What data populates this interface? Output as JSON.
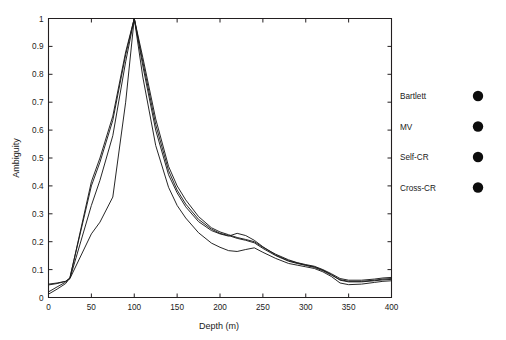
{
  "chart_data": {
    "type": "line",
    "title": "",
    "xlabel": "Depth (m)",
    "ylabel": "Ambiguity",
    "xlim": [
      0,
      400
    ],
    "ylim": [
      0,
      1
    ],
    "grid": false,
    "legend_position": "right-outside",
    "xticks": [
      0,
      50,
      100,
      150,
      200,
      250,
      300,
      350,
      400
    ],
    "xtick_labels": [
      "0",
      "50",
      "100",
      "150",
      "200",
      "250",
      "300",
      "350",
      "400"
    ],
    "yticks": [
      0,
      0.1,
      0.2,
      0.3,
      0.4,
      0.5,
      0.6,
      0.7,
      0.8,
      0.9,
      1
    ],
    "ytick_labels": [
      "0",
      "0.1",
      "0.2",
      "0.3",
      "0.4",
      "0.5",
      "0.6",
      "0.7",
      "0.8",
      "0.9",
      "1"
    ],
    "x": [
      0,
      10,
      20,
      25,
      50,
      60,
      75,
      90,
      100,
      110,
      125,
      140,
      150,
      160,
      175,
      190,
      200,
      210,
      220,
      230,
      240,
      250,
      265,
      280,
      290,
      300,
      310,
      320,
      330,
      340,
      350,
      365,
      380,
      390,
      400
    ],
    "series": [
      {
        "name": "Bartlett",
        "marker": "filled-circle",
        "color": "#0d0d0d",
        "values": [
          0.012,
          0.03,
          0.05,
          0.07,
          0.415,
          0.5,
          0.65,
          0.88,
          1.0,
          0.86,
          0.64,
          0.47,
          0.4,
          0.35,
          0.29,
          0.25,
          0.235,
          0.225,
          0.215,
          0.208,
          0.2,
          0.18,
          0.155,
          0.135,
          0.125,
          0.118,
          0.112,
          0.1,
          0.085,
          0.068,
          0.062,
          0.062,
          0.066,
          0.07,
          0.072
        ]
      },
      {
        "name": "MV",
        "marker": "filled-circle",
        "color": "#0d0d0d",
        "values": [
          0.02,
          0.038,
          0.055,
          0.072,
          0.4,
          0.485,
          0.635,
          0.87,
          1.0,
          0.845,
          0.62,
          0.455,
          0.385,
          0.335,
          0.28,
          0.245,
          0.23,
          0.222,
          0.212,
          0.205,
          0.196,
          0.176,
          0.15,
          0.13,
          0.122,
          0.115,
          0.108,
          0.096,
          0.08,
          0.064,
          0.058,
          0.058,
          0.062,
          0.066,
          0.068
        ]
      },
      {
        "name": "Self-CR",
        "marker": "filled-circle",
        "color": "#0d0d0d",
        "values": [
          0.048,
          0.052,
          0.058,
          0.068,
          0.33,
          0.42,
          0.58,
          0.845,
          1.0,
          0.83,
          0.6,
          0.44,
          0.375,
          0.325,
          0.272,
          0.24,
          0.228,
          0.22,
          0.23,
          0.222,
          0.205,
          0.182,
          0.152,
          0.132,
          0.124,
          0.116,
          0.11,
          0.098,
          0.082,
          0.062,
          0.056,
          0.056,
          0.06,
          0.063,
          0.065
        ]
      },
      {
        "name": "Cross-CR",
        "marker": "filled-circle",
        "color": "#0d0d0d",
        "values": [
          0.045,
          0.05,
          0.058,
          0.068,
          0.228,
          0.27,
          0.36,
          0.7,
          1.0,
          0.79,
          0.545,
          0.395,
          0.33,
          0.285,
          0.232,
          0.195,
          0.18,
          0.168,
          0.165,
          0.172,
          0.178,
          0.162,
          0.14,
          0.122,
          0.116,
          0.11,
          0.104,
          0.092,
          0.075,
          0.052,
          0.046,
          0.048,
          0.054,
          0.058,
          0.06
        ]
      }
    ]
  },
  "legend": {
    "entries": [
      {
        "label": "Bartlett"
      },
      {
        "label": "MV"
      },
      {
        "label": "Self-CR"
      },
      {
        "label": "Cross-CR"
      }
    ]
  }
}
